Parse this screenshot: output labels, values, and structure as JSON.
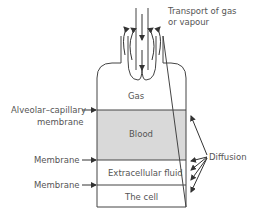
{
  "diagram": {
    "top_label_line1": "Transport of gas",
    "top_label_line2": "or vapour",
    "compartments": {
      "gas": "Gas",
      "blood": "Blood",
      "extracellular": "Extracellular fluid",
      "cell": "The cell"
    },
    "left_labels": {
      "alveolar_line1": "Alveolar–capillary",
      "alveolar_line2": "membrane",
      "membrane1": "Membrane",
      "membrane2": "Membrane"
    },
    "right_label": "Diffusion",
    "colors": {
      "blood_fill": "#d9d9d9",
      "line": "#444444",
      "text": "#555555"
    }
  }
}
